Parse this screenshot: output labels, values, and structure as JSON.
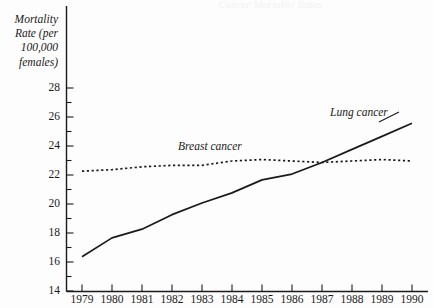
{
  "figure": {
    "background_color": "#fdfdfd",
    "ink_color": "#1a1a1a",
    "partial_title": "Cancer Mortality Rates"
  },
  "axes": {
    "y_axis_title": "Mortality\nRate (per\n100,000\nfemales)",
    "y_tick_labels": [
      "28",
      "26",
      "24",
      "22",
      "20",
      "18",
      "16",
      "14"
    ],
    "x_tick_labels": [
      "1979",
      "1980",
      "1981",
      "1982",
      "1983",
      "1984",
      "1985",
      "1986",
      "1987",
      "1988",
      "1989",
      "1990"
    ]
  },
  "series_labels": {
    "breast": "Breast cancer",
    "lung": "Lung cancer"
  },
  "chart_data": {
    "type": "line",
    "title": "",
    "xlabel": "",
    "ylabel": "Mortality Rate (per 100,000 females)",
    "x": [
      1979,
      1980,
      1981,
      1982,
      1983,
      1984,
      1985,
      1986,
      1987,
      1988,
      1989,
      1990
    ],
    "xlim": [
      1979,
      1990
    ],
    "ylim": [
      14,
      28
    ],
    "y_major_ticks": [
      14,
      16,
      18,
      20,
      22,
      24,
      26,
      28
    ],
    "y_minor_ticks": [
      15,
      17,
      19,
      21,
      23,
      25,
      27
    ],
    "grid": false,
    "legend": "inline-annotation",
    "series": [
      {
        "name": "Lung cancer",
        "style": "solid",
        "values": [
          16.4,
          17.7,
          18.3,
          19.3,
          20.1,
          20.8,
          21.7,
          22.1,
          22.9,
          23.8,
          24.7,
          25.6
        ]
      },
      {
        "name": "Breast cancer",
        "style": "dotted",
        "values": [
          22.3,
          22.4,
          22.6,
          22.7,
          22.7,
          23.0,
          23.1,
          23.0,
          22.9,
          23.0,
          23.1,
          23.0
        ]
      }
    ]
  }
}
